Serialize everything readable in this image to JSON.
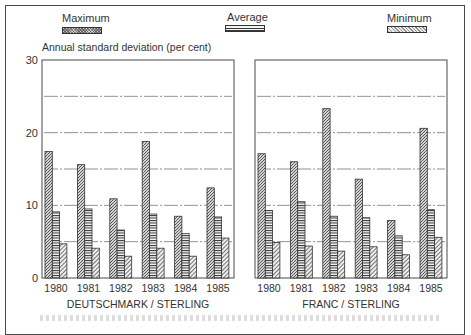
{
  "legend": {
    "maximum_label": "Maximum",
    "average_label": "Average",
    "minimum_label": "Minimum"
  },
  "axis": {
    "ylabel": "Annual standard deviation (per cent)",
    "yticks": [
      "30",
      "20",
      "10",
      "0"
    ]
  },
  "panels": [
    {
      "title": "DEUTSCHMARK / STERLING"
    },
    {
      "title": "FRANC / STERLING"
    }
  ],
  "chart_data": [
    {
      "type": "bar",
      "title": "DEUTSCHMARK / STERLING",
      "xlabel": "",
      "ylabel": "Annual standard deviation (per cent)",
      "ylim": [
        0,
        30
      ],
      "yticks": [
        0,
        10,
        20,
        30
      ],
      "grid": "dashed horizontal lines at 5, 10, 15, 20, 25",
      "legend_position": "top",
      "categories": [
        "1980",
        "1981",
        "1982",
        "1983",
        "1984",
        "1985"
      ],
      "series": [
        {
          "name": "Maximum",
          "values": [
            17.4,
            15.6,
            10.9,
            18.8,
            8.5,
            12.4
          ]
        },
        {
          "name": "Average",
          "values": [
            9.1,
            9.5,
            6.6,
            8.8,
            6.1,
            8.4
          ]
        },
        {
          "name": "Minimum",
          "values": [
            4.7,
            4.1,
            3.0,
            4.1,
            3.0,
            5.5
          ]
        }
      ]
    },
    {
      "type": "bar",
      "title": "FRANC / STERLING",
      "xlabel": "",
      "ylabel": "Annual standard deviation (per cent)",
      "ylim": [
        0,
        30
      ],
      "yticks": [
        0,
        10,
        20,
        30
      ],
      "grid": "dashed horizontal lines at 5, 10, 15, 20, 25",
      "legend_position": "top",
      "categories": [
        "1980",
        "1981",
        "1982",
        "1983",
        "1984",
        "1985"
      ],
      "series": [
        {
          "name": "Maximum",
          "values": [
            17.1,
            16.0,
            23.3,
            13.6,
            7.9,
            20.6
          ]
        },
        {
          "name": "Average",
          "values": [
            9.3,
            10.5,
            8.5,
            8.3,
            5.8,
            9.4
          ]
        },
        {
          "name": "Minimum",
          "values": [
            4.9,
            4.4,
            3.7,
            4.3,
            3.2,
            5.6
          ]
        }
      ]
    }
  ]
}
